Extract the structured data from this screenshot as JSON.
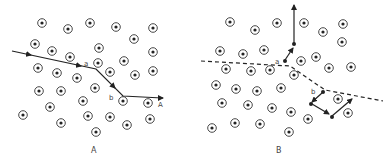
{
  "panels": [
    {
      "id": "A",
      "caption": "A",
      "path_labels": {
        "a": "a",
        "b": "b",
        "end": "A"
      },
      "atoms": [
        [
          42,
          23
        ],
        [
          68,
          29
        ],
        [
          90,
          23
        ],
        [
          116,
          27
        ],
        [
          153,
          28
        ],
        [
          134,
          39
        ],
        [
          35,
          44
        ],
        [
          52,
          51
        ],
        [
          99,
          48
        ],
        [
          153,
          52
        ],
        [
          70,
          57
        ],
        [
          98,
          63
        ],
        [
          124,
          61
        ],
        [
          38,
          68
        ],
        [
          57,
          73
        ],
        [
          110,
          72
        ],
        [
          135,
          75
        ],
        [
          153,
          71
        ],
        [
          77,
          78
        ],
        [
          39,
          91
        ],
        [
          61,
          91
        ],
        [
          95,
          88
        ],
        [
          83,
          101
        ],
        [
          123,
          101
        ],
        [
          148,
          103
        ],
        [
          50,
          107
        ],
        [
          23,
          115
        ],
        [
          88,
          116
        ],
        [
          110,
          117
        ],
        [
          150,
          119
        ],
        [
          61,
          123
        ],
        [
          127,
          125
        ],
        [
          96,
          132
        ]
      ],
      "trajectory": [
        [
          12,
          51
        ],
        [
          96,
          69
        ],
        [
          123,
          96
        ],
        [
          162,
          98
        ]
      ]
    },
    {
      "id": "B",
      "caption": "B",
      "path_labels": {
        "a": "a",
        "b": "b"
      },
      "atoms": [
        [
          230,
          22
        ],
        [
          255,
          30
        ],
        [
          277,
          23
        ],
        [
          304,
          23
        ],
        [
          323,
          32
        ],
        [
          343,
          24
        ],
        [
          342,
          42
        ],
        [
          220,
          51
        ],
        [
          243,
          54
        ],
        [
          264,
          50
        ],
        [
          301,
          61
        ],
        [
          316,
          57
        ],
        [
          226,
          69
        ],
        [
          251,
          71
        ],
        [
          270,
          70
        ],
        [
          294,
          75
        ],
        [
          329,
          68
        ],
        [
          351,
          67
        ],
        [
          216,
          85
        ],
        [
          236,
          89
        ],
        [
          257,
          91
        ],
        [
          281,
          88
        ],
        [
          338,
          99
        ],
        [
          222,
          103
        ],
        [
          248,
          105
        ],
        [
          272,
          108
        ],
        [
          291,
          112
        ],
        [
          348,
          113
        ],
        [
          308,
          119
        ],
        [
          212,
          128
        ],
        [
          235,
          123
        ],
        [
          260,
          124
        ],
        [
          289,
          132
        ]
      ],
      "dashed_boundary": [
        [
          201,
          61
        ],
        [
          290,
          66
        ],
        [
          325,
          90
        ],
        [
          383,
          101
        ]
      ]
    }
  ],
  "colors": {
    "ink": "#222222",
    "label": "#555555",
    "background": "#ffffff"
  }
}
